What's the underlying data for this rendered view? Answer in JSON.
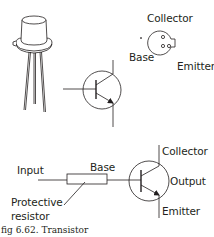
{
  "figure": {
    "caption": "fig 6.62. Transistor"
  },
  "pinout": {
    "collector_label": "Collector",
    "base_label": "Base",
    "emitter_label": "Emitter"
  },
  "circuit": {
    "input_label": "Input",
    "base_label": "Base",
    "collector_label": "Collector",
    "output_label": "Output",
    "emitter_label": "Emitter",
    "resistor_label_line1": "Protective",
    "resistor_label_line2": "resistor"
  },
  "colors": {
    "stroke": "#231f20",
    "background": "#ffffff"
  }
}
